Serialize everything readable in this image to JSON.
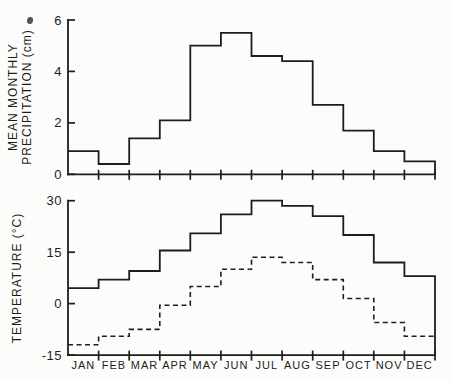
{
  "figure": {
    "ink": "#1d1d1d",
    "background": "#fcfcfa",
    "width": 453,
    "height": 381
  },
  "chart_data": [
    {
      "type": "step",
      "panel": "precipitation",
      "ylabel": "MEAN MONTHLY PRECIPITATION (cm)",
      "ylabel_lines": [
        "MEAN MONTHLY",
        "PRECIPITATION (cm)"
      ],
      "ylim": [
        0,
        6
      ],
      "yticks": [
        0,
        2,
        4,
        6
      ],
      "grid": false,
      "x_tick_labels_shown": false,
      "categories": [
        "JAN",
        "FEB",
        "MAR",
        "APR",
        "MAY",
        "JUN",
        "JUL",
        "AUG",
        "SEP",
        "OCT",
        "NOV",
        "DEC"
      ],
      "series": [
        {
          "name": "mean-monthly-precipitation-cm",
          "style": "solid",
          "closes_to_axis": true,
          "values": [
            0.9,
            0.4,
            1.4,
            2.1,
            5.0,
            5.5,
            4.6,
            4.4,
            2.7,
            1.7,
            0.9,
            0.5
          ]
        }
      ]
    },
    {
      "type": "step",
      "panel": "temperature",
      "ylabel": "TEMPERATURE (°C)",
      "ylabel_lines": [
        "TEMPERATURE (°C)"
      ],
      "ylim": [
        -15,
        30
      ],
      "yticks": [
        -15,
        0,
        15,
        30
      ],
      "grid": false,
      "x_tick_labels_shown": true,
      "categories": [
        "JAN",
        "FEB",
        "MAR",
        "APR",
        "MAY",
        "JUN",
        "JUL",
        "AUG",
        "SEP",
        "OCT",
        "NOV",
        "DEC"
      ],
      "series": [
        {
          "name": "temperature-high-c",
          "style": "solid",
          "closes_to_axis": true,
          "values": [
            4.5,
            7,
            9.5,
            15.5,
            20.5,
            26,
            30,
            28.5,
            25.5,
            20,
            12,
            8
          ]
        },
        {
          "name": "temperature-low-c",
          "style": "dashed",
          "closes_to_axis": false,
          "values": [
            -12,
            -9.5,
            -7.5,
            -0.5,
            5,
            10,
            13.5,
            12,
            7,
            1.5,
            -5.5,
            -9.5
          ]
        }
      ]
    }
  ]
}
